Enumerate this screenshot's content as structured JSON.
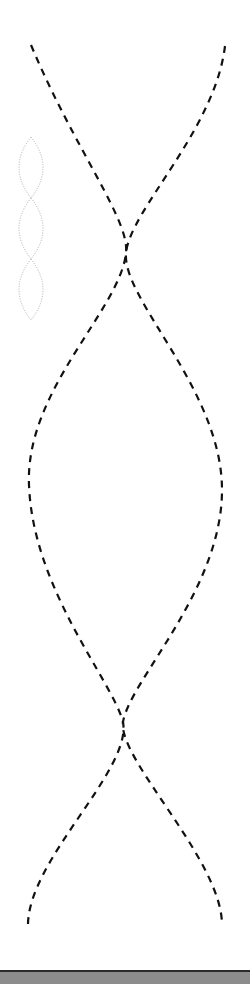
{
  "diagram": {
    "type": "double-helix-strands",
    "background": "#ffffff",
    "main_strands": {
      "stroke": "#111111",
      "stroke_width": 2.2,
      "dash": "7 6",
      "left_strand": "M31,45 C75,150 130,220 126,253 C120,310 25,390 29,485 C33,590 112,680 123,722 C132,770 28,860 28,925",
      "right_strand": "M225,46 C215,130 130,210 126,253 C122,300 222,390 222,490 C222,590 130,680 123,722 C118,760 222,860 222,925"
    },
    "mini_helix": {
      "stroke": "#9a9a9a",
      "stroke_width": 0.8,
      "dash": "1 1.5",
      "lobes": [
        {
          "top": 137,
          "bottom": 198,
          "cx": 31,
          "rx": 12
        },
        {
          "top": 198,
          "bottom": 259,
          "cx": 31,
          "rx": 12
        },
        {
          "top": 259,
          "bottom": 320,
          "cx": 31,
          "rx": 12
        }
      ]
    },
    "bottom_bar": {
      "color": "#8c8c8c",
      "border": "#2a2a2a"
    }
  }
}
